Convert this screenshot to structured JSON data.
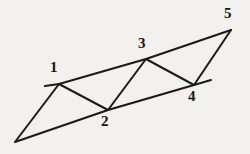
{
  "figure": {
    "background_color": "#f2f1ee",
    "line_color": "#1a1a1a",
    "label_color": "#151515",
    "canvas": {
      "width": 250,
      "height": 154
    },
    "vertices": [
      {
        "id": "apex-left",
        "label": "",
        "x": 15,
        "y": 142
      },
      {
        "id": "v1",
        "label": "1",
        "x": 59,
        "y": 84,
        "label_x": 50,
        "label_y": 60
      },
      {
        "id": "v2",
        "label": "2",
        "x": 108,
        "y": 110,
        "label_x": 101,
        "label_y": 114
      },
      {
        "id": "v3",
        "label": "3",
        "x": 146,
        "y": 59,
        "label_x": 138,
        "label_y": 36
      },
      {
        "id": "v4",
        "label": "4",
        "x": 194,
        "y": 85,
        "label_x": 188,
        "label_y": 89
      },
      {
        "id": "v5",
        "label": "5",
        "x": 231,
        "y": 30,
        "label_x": 224,
        "label_y": 6
      }
    ],
    "edges": [
      {
        "id": "top-rail",
        "kind": "rail",
        "points": "45,86 59,84 146,59 231,30"
      },
      {
        "id": "bottom-rail",
        "kind": "rail",
        "points": "15,142 108,110 194,85 211,80"
      },
      {
        "id": "apex-to-1",
        "kind": "web",
        "points": "15,142 59,84"
      },
      {
        "id": "edge-1-2",
        "kind": "web",
        "points": "59,84 108,110"
      },
      {
        "id": "edge-2-3",
        "kind": "web",
        "points": "108,110 146,59"
      },
      {
        "id": "edge-3-4",
        "kind": "web",
        "points": "146,59 194,85"
      },
      {
        "id": "edge-4-5",
        "kind": "web",
        "points": "194,85 231,30"
      }
    ],
    "labels": [
      "1",
      "2",
      "3",
      "4",
      "5"
    ]
  }
}
